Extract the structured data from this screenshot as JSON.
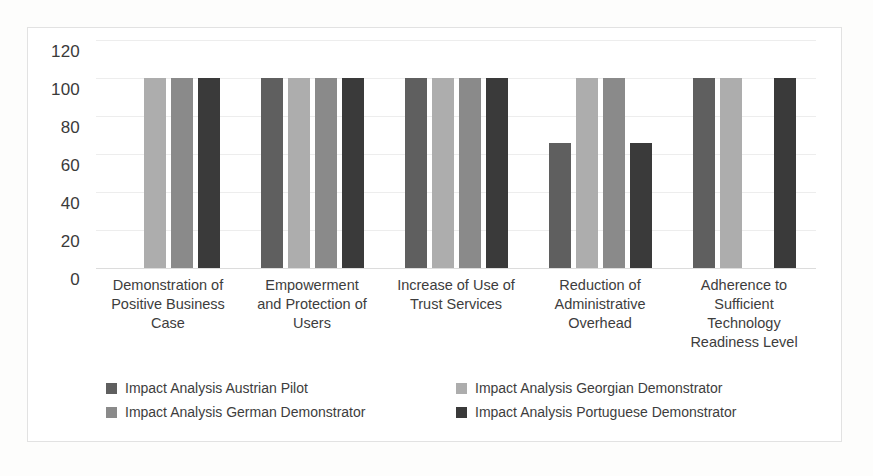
{
  "chart_data": {
    "type": "bar",
    "title": "",
    "subtitle": "",
    "xlabel": "",
    "ylabel": "",
    "ylim": [
      0,
      120
    ],
    "y_ticks": [
      0,
      20,
      40,
      60,
      80,
      100,
      120
    ],
    "grid": true,
    "legend_position": "bottom",
    "categories": [
      "Demonstration of\nPositive Business\nCase",
      "Empowerment\nand Protection of\nUsers",
      "Increase of Use of\nTrust Services",
      "Reduction of\nAdministrative\nOverhead",
      "Adherence to\nSufficient\nTechnology\nReadiness Level"
    ],
    "series": [
      {
        "name": "Impact Analysis Austrian Pilot",
        "color": "#5f5f5f",
        "values": [
          0,
          100,
          100,
          66,
          100
        ]
      },
      {
        "name": "Impact Analysis Georgian Demonstrator",
        "color": "#adadad",
        "values": [
          100,
          100,
          100,
          100,
          100
        ]
      },
      {
        "name": "Impact Analysis German Demonstrator",
        "color": "#8a8a8a",
        "values": [
          100,
          100,
          100,
          100,
          0
        ]
      },
      {
        "name": "Impact Analysis Portuguese Demonstrator",
        "color": "#3a3a3a",
        "values": [
          100,
          100,
          100,
          66,
          100
        ]
      }
    ]
  },
  "legend": {
    "items": [
      {
        "label": "Impact Analysis Austrian Pilot",
        "color": "#5f5f5f"
      },
      {
        "label": "Impact Analysis Georgian Demonstrator",
        "color": "#adadad"
      },
      {
        "label": "Impact Analysis German Demonstrator",
        "color": "#8a8a8a"
      },
      {
        "label": "Impact Analysis Portuguese Demonstrator",
        "color": "#3a3a3a"
      }
    ]
  },
  "style": {
    "plot_background": "#ffffff",
    "frame_border": "#e2e2e2",
    "gridline_color": "#ededed",
    "text_color": "#3d3d3d"
  }
}
